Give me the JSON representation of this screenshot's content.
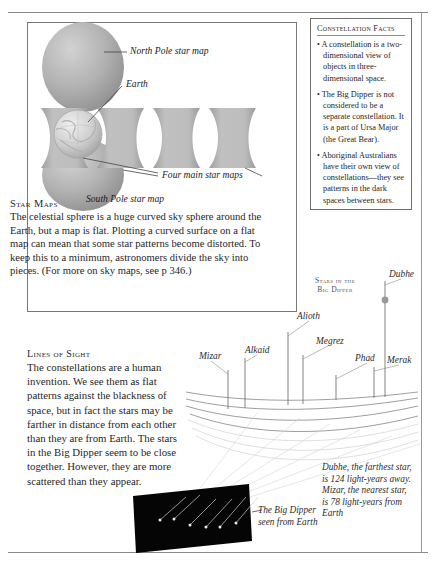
{
  "document": {
    "title": "Star Maps and Lines of Sight"
  },
  "facts_panel": {
    "title": "Constellation Facts",
    "bullets": [
      "A constellation is a two-dimensional view of objects in three-dimensional space.",
      "The Big Dipper is not considered to be a separate constellation. It is a part of Ursa Major (the Great Bear).",
      "Aboriginal Australians have their own view of constellations—they see patterns in the dark spaces between stars."
    ],
    "bullet_glyph": "•"
  },
  "star_maps": {
    "title": "Star Maps",
    "body": "The celestial sphere is a huge curved sky sphere around the Earth, but a map is flat. Plotting a curved surface on a flat map can mean that some star patterns become distorted. To keep this to a minimum, astronomers divide the sky into pieces. (For more on sky maps, see p 346.)"
  },
  "diagram_labels": {
    "north_pole": "North Pole star map",
    "earth": "Earth",
    "four_main": "Four main star maps",
    "south_pole": "South Pole star map"
  },
  "lines_of_sight": {
    "title": "Lines of Sight",
    "body": "The constellations are a human invention. We see them as flat patterns against the blackness of space, but in fact the stars may be farther in distance from each other than they are from Earth. The stars in the Big Dipper seem to be close together. However, they are more scattered than they appear."
  },
  "big_dipper": {
    "heading_line1": "Stars in the",
    "heading_line2": "Big Dipper",
    "stars": [
      {
        "name": "Mizar",
        "label_x": 199,
        "label_y": 351,
        "pole_x": 228,
        "pole_top": 370,
        "pole_bottom": 409,
        "dot": false
      },
      {
        "name": "Alkaid",
        "label_x": 245,
        "label_y": 345,
        "pole_x": 245,
        "pole_top": 358,
        "pole_bottom": 408,
        "dot": false
      },
      {
        "name": "Alioth",
        "label_x": 297,
        "label_y": 311,
        "pole_x": 288,
        "pole_top": 332,
        "pole_bottom": 405,
        "dot": false
      },
      {
        "name": "Megrez",
        "label_x": 316,
        "label_y": 336,
        "pole_x": 303,
        "pole_top": 355,
        "pole_bottom": 404,
        "dot": false
      },
      {
        "name": "Phad",
        "label_x": 355,
        "label_y": 353,
        "pole_x": 336,
        "pole_top": 375,
        "pole_bottom": 400,
        "dot": false
      },
      {
        "name": "Merak",
        "label_x": 387,
        "label_y": 355,
        "pole_x": 374,
        "pole_top": 367,
        "pole_bottom": 398,
        "dot": false
      },
      {
        "name": "Dubhe",
        "label_x": 389,
        "label_y": 269,
        "pole_x": 385,
        "pole_top": 281,
        "pole_bottom": 397,
        "dot": true
      }
    ]
  },
  "captions": {
    "big_dipper_view": "The Big Dipper seen from Earth",
    "distances": "Dubhe, the farthest star, is 124 light-years away. Mizar, the nearest star, is 78 light-years from Earth"
  },
  "colors": {
    "page_background": "#ffffff",
    "text": "#1f1f1f",
    "rule": "#8a8a8a",
    "box_border": "#777777",
    "map_fill_light": "#c3c3c3",
    "map_fill_dark": "#9d9d9d",
    "sky_panel": "#050505",
    "star_dot": "#9a9a9a"
  }
}
